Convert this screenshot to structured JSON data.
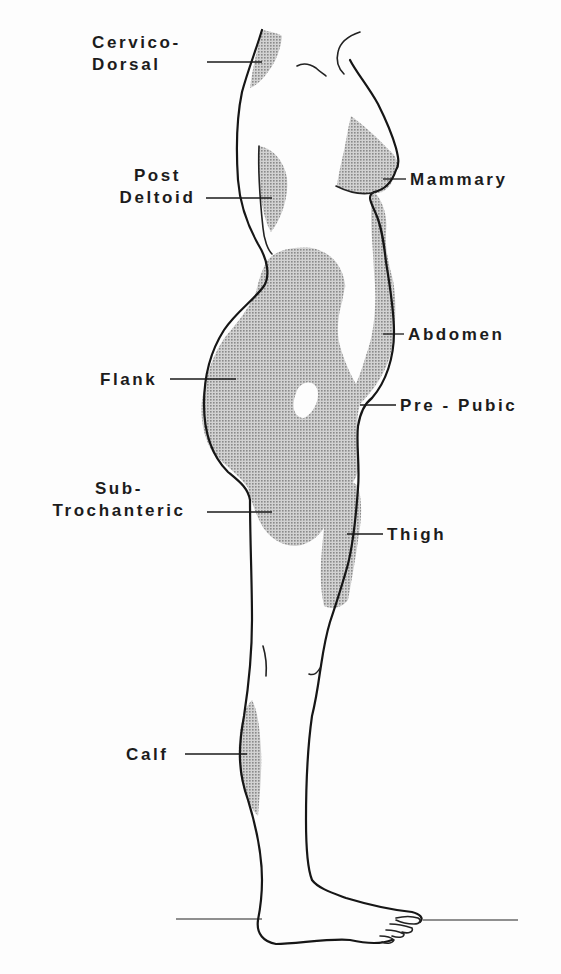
{
  "figure": {
    "type": "anatomical-lateral-view",
    "shading_color": "#b8b8b8",
    "line_color": "#161616",
    "background": "#fdfdfd"
  },
  "labels": [
    {
      "id": "cervico-dorsal",
      "lines": [
        "Cervico-",
        "Dorsal"
      ],
      "side": "left",
      "x": 92,
      "y": 32,
      "w": 110,
      "align": "left",
      "leader": [
        207,
        62,
        262,
        62
      ]
    },
    {
      "id": "post-deltoid",
      "lines": [
        "Post",
        "Deltoid"
      ],
      "side": "left",
      "x": 110,
      "y": 165,
      "w": 95,
      "align": "center",
      "leader": [
        206,
        198,
        272,
        198
      ]
    },
    {
      "id": "mammary",
      "lines": [
        "Mammary"
      ],
      "side": "right",
      "x": 410,
      "y": 169,
      "w": 120,
      "align": "left",
      "leader": [
        383,
        179,
        406,
        179
      ]
    },
    {
      "id": "abdomen",
      "lines": [
        "Abdomen"
      ],
      "side": "right",
      "x": 408,
      "y": 324,
      "w": 120,
      "align": "left",
      "leader": [
        383,
        334,
        404,
        334
      ]
    },
    {
      "id": "flank",
      "lines": [
        "Flank"
      ],
      "side": "left",
      "x": 100,
      "y": 369,
      "w": 70,
      "align": "left",
      "leader": [
        170,
        379,
        236,
        379
      ]
    },
    {
      "id": "pre-pubic",
      "lines": [
        "Pre - Pubic"
      ],
      "side": "right",
      "x": 400,
      "y": 395,
      "w": 140,
      "align": "left",
      "leader": [
        360,
        405,
        396,
        405
      ]
    },
    {
      "id": "sub-trochanteric",
      "lines": [
        "Sub-",
        "Trochanteric"
      ],
      "side": "left",
      "x": 38,
      "y": 478,
      "w": 162,
      "align": "center",
      "leader": [
        207,
        512,
        272,
        512
      ]
    },
    {
      "id": "thigh",
      "lines": [
        "Thigh"
      ],
      "side": "right",
      "x": 387,
      "y": 524,
      "w": 80,
      "align": "left",
      "leader": [
        347,
        534,
        383,
        534
      ]
    },
    {
      "id": "calf",
      "lines": [
        "Calf"
      ],
      "side": "left",
      "x": 126,
      "y": 744,
      "w": 60,
      "align": "left",
      "leader": [
        185,
        754,
        247,
        754
      ]
    }
  ],
  "ground_line": {
    "left": [
      176,
      919,
      262,
      919
    ],
    "right": [
      423,
      920,
      518,
      920
    ]
  }
}
